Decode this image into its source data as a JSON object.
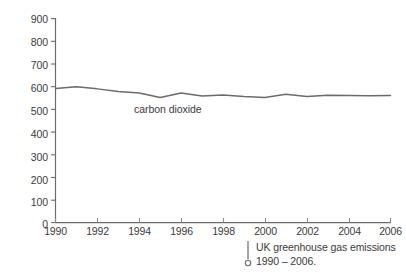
{
  "chart_data": {
    "type": "line",
    "title": "",
    "caption": "UK greenhouse gas emissions 1990 – 2006.",
    "caption_line1": "UK greenhouse gas emissions",
    "caption_line2": "1990 – 2006.",
    "xlabel": "",
    "ylabel_text": "million tonnes CO",
    "ylabel_sub": "2",
    "ylabel_full": "million tonnes CO2",
    "xlim": [
      1990,
      2006
    ],
    "ylim": [
      0,
      900
    ],
    "grid": false,
    "legend_position": "inline-annotation",
    "x_tick_labels": [
      "1990",
      "1992",
      "1994",
      "1996",
      "1998",
      "2000",
      "2002",
      "2004",
      "2006"
    ],
    "x_tick_values": [
      1990,
      1992,
      1994,
      1996,
      1998,
      2000,
      2002,
      2004,
      2006
    ],
    "y_tick_labels": [
      "0",
      "100",
      "200",
      "300",
      "400",
      "500",
      "600",
      "700",
      "800",
      "900"
    ],
    "y_tick_values": [
      0,
      100,
      200,
      300,
      400,
      500,
      600,
      700,
      800,
      900
    ],
    "x": [
      1990,
      1991,
      1992,
      1993,
      1994,
      1995,
      1996,
      1997,
      1998,
      1999,
      2000,
      2001,
      2002,
      2003,
      2004,
      2005,
      2006
    ],
    "series": [
      {
        "name": "carbon dioxide",
        "label": "carbon dioxide",
        "color": "#6b6b6b",
        "values": [
          592,
          599,
          590,
          578,
          572,
          552,
          572,
          559,
          563,
          556,
          552,
          566,
          556,
          562,
          561,
          560,
          561
        ]
      }
    ],
    "annotations": [
      {
        "name": "series-inline-label",
        "text": "carbon dioxide",
        "x": 1996,
        "y": 505
      }
    ],
    "axis_color": "#6b6b6b"
  }
}
